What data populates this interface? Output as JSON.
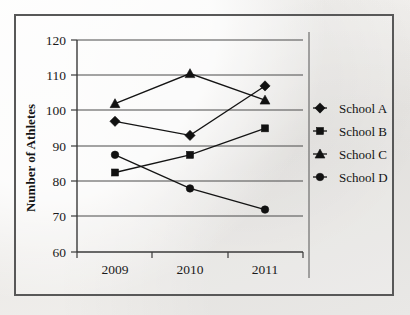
{
  "figure": {
    "frame_border_color": "#585858",
    "background_color": "#f1f0ee",
    "ink_color": "#111111"
  },
  "chart_data": {
    "type": "line",
    "title": "",
    "xlabel": "",
    "ylabel": "Number of Athletes",
    "categories": [
      "2009",
      "2010",
      "2011"
    ],
    "x": [
      2009,
      2010,
      2011
    ],
    "ylim": [
      60,
      120
    ],
    "yticks": [
      60,
      70,
      80,
      90,
      100,
      110,
      120
    ],
    "ytick_labels": [
      "60",
      "70",
      "80",
      "90",
      "100",
      "110",
      "120"
    ],
    "grid": "horizontal",
    "legend_position": "right",
    "series": [
      {
        "name": "School A",
        "marker": "diamond",
        "values": [
          97,
          93,
          107
        ]
      },
      {
        "name": "School B",
        "marker": "square",
        "values": [
          82.5,
          87.5,
          95
        ]
      },
      {
        "name": "School C",
        "marker": "triangle",
        "values": [
          102,
          110.5,
          103
        ]
      },
      {
        "name": "School D",
        "marker": "circle",
        "values": [
          87.5,
          78,
          72
        ]
      }
    ]
  },
  "legend": {
    "entries": [
      {
        "label": "School A",
        "marker_name": "diamond-marker-icon"
      },
      {
        "label": "School B",
        "marker_name": "square-marker-icon"
      },
      {
        "label": "School C",
        "marker_name": "triangle-marker-icon"
      },
      {
        "label": "School D",
        "marker_name": "circle-marker-icon"
      }
    ]
  }
}
